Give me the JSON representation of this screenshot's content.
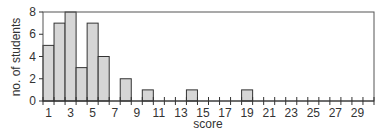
{
  "chart_data": {
    "type": "bar",
    "title": "",
    "xlabel": "score",
    "ylabel": "no. of students",
    "categories": [
      1,
      2,
      3,
      4,
      5,
      6,
      7,
      8,
      9,
      10,
      11,
      12,
      13,
      14,
      15,
      16,
      17,
      18,
      19,
      20,
      21,
      22,
      23,
      24,
      25,
      26,
      27,
      28,
      29,
      30
    ],
    "values": [
      5,
      7,
      8,
      3,
      7,
      4,
      0,
      2,
      0,
      1,
      0,
      0,
      0,
      1,
      0,
      0,
      0,
      0,
      1,
      0,
      0,
      0,
      0,
      0,
      0,
      0,
      0,
      0,
      0,
      0
    ],
    "x_tick_labels": [
      "1",
      "3",
      "5",
      "7",
      "9",
      "11",
      "13",
      "15",
      "17",
      "19",
      "21",
      "23",
      "25",
      "27",
      "29"
    ],
    "y_ticks": [
      0,
      2,
      4,
      6,
      8
    ],
    "ylim": [
      0,
      8
    ],
    "xlim": [
      0.5,
      30.5
    ],
    "grid": false,
    "legend": null,
    "bar_color": "#d6d6d6",
    "edge_color": "#333333"
  }
}
